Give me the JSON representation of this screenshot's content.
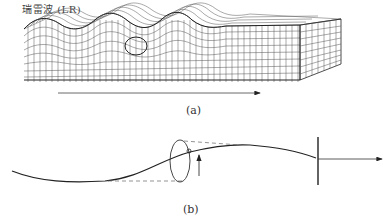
{
  "diagram": {
    "title": "瑞雷波 (LR)",
    "panels": [
      {
        "id": "a",
        "caption": "(a)",
        "description": "3D gridded medium block with Rayleigh wave surface undulation (three crests), particle orbit circle, propagation direction arrow"
      },
      {
        "id": "b",
        "caption": "(b)",
        "description": "Wave profile curve with elliptical particle motion, dashed projection lines, upward displacement arrow, vertical wavefront line and propagation arrow"
      }
    ],
    "colors": {
      "line": "#222222",
      "grid": "#555555",
      "dashed": "#666666"
    }
  }
}
